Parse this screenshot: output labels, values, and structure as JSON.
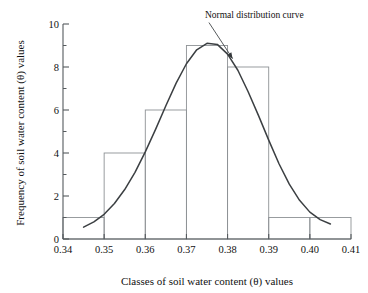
{
  "chart_data": {
    "type": "bar",
    "title": "",
    "xlabel": "Classes of soil water content (θ) values",
    "ylabel": "Frequency of soil water content (θ) values",
    "xlim": [
      0.34,
      0.41
    ],
    "ylim": [
      0,
      10
    ],
    "grid": false,
    "legend_position": "none",
    "x_major_ticks": [
      "0.34",
      "0.35",
      "0.36",
      "0.37",
      "0.38",
      "0.39",
      "0.40",
      "0.41"
    ],
    "x_major_tick_values": [
      0.34,
      0.35,
      0.36,
      0.37,
      0.38,
      0.39,
      0.4,
      0.41
    ],
    "y_major_ticks": [
      "0",
      "2",
      "4",
      "6",
      "8",
      "10"
    ],
    "y_major_tick_values": [
      0,
      2,
      4,
      6,
      8,
      10
    ],
    "y_minor_tick_values": [
      1,
      3,
      5,
      7,
      9
    ],
    "bin_edges": [
      0.34,
      0.35,
      0.36,
      0.37,
      0.38,
      0.39,
      0.4,
      0.41
    ],
    "categories": [
      "0.34-0.35",
      "0.35-0.36",
      "0.36-0.37",
      "0.37-0.38",
      "0.38-0.39",
      "0.39-0.40",
      "0.40-0.41"
    ],
    "values": [
      1,
      4,
      6,
      9,
      8,
      1,
      1
    ],
    "series": [
      {
        "name": "Histogram of soil water content",
        "values": [
          1,
          4,
          6,
          9,
          8,
          1,
          1
        ]
      },
      {
        "name": "Normal distribution curve",
        "type": "line",
        "mean": 0.3755,
        "peak_value": 9.1,
        "x": [
          0.345,
          0.3475,
          0.35,
          0.3525,
          0.355,
          0.3575,
          0.36,
          0.3625,
          0.365,
          0.3675,
          0.37,
          0.3725,
          0.375,
          0.3775,
          0.38,
          0.3825,
          0.385,
          0.3875,
          0.39,
          0.3925,
          0.395,
          0.3975,
          0.4,
          0.4025,
          0.405
        ],
        "y": [
          0.55,
          0.8,
          1.15,
          1.65,
          2.3,
          3.1,
          4.05,
          5.1,
          6.2,
          7.25,
          8.15,
          8.8,
          9.1,
          9.05,
          8.6,
          7.85,
          6.85,
          5.75,
          4.6,
          3.5,
          2.55,
          1.8,
          1.25,
          0.9,
          0.7
        ]
      }
    ],
    "annotations": [
      {
        "text": "Normal distribution curve",
        "text_x": 0.3745,
        "text_y": 10.3,
        "arrow_tip_x": 0.3805,
        "arrow_tip_y": 8.25
      }
    ]
  }
}
